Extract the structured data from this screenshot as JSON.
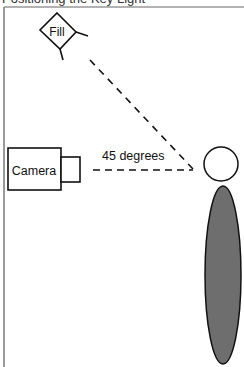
{
  "caption": "Positioning the Key Light",
  "diagram": {
    "fill_light": {
      "label": "Fill"
    },
    "camera": {
      "label": "Camera"
    },
    "angle": {
      "label": "45 degrees"
    },
    "subject": {
      "body_color": "#6e6e6e",
      "head_color": "#ffffff"
    },
    "colors": {
      "stroke": "#111111",
      "frame": "#777777"
    }
  }
}
